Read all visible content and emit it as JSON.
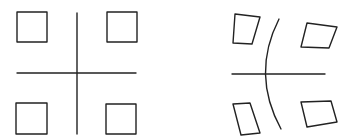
{
  "diagram": {
    "background": "#ffffff",
    "stroke_color": "#222222",
    "stroke_width": 1.4,
    "panels": [
      {
        "name": "undistorted-grid",
        "horizontal_line": {
          "x1": 17,
          "y1": 73,
          "x2": 136,
          "y2": 73
        },
        "vertical_line": {
          "x1": 77,
          "y1": 13,
          "x2": 77,
          "y2": 134
        },
        "squares": [
          {
            "points": "17,12 47,12 47,42 17,42"
          },
          {
            "points": "107,12 137,12 137,42 107,42"
          },
          {
            "points": "16,103 47,103 47,134 16,134"
          },
          {
            "points": "106,104 136,104 136,134 106,134"
          }
        ]
      },
      {
        "name": "distorted-grid",
        "horizontal_line": {
          "x1": 232,
          "y1": 74,
          "x2": 325,
          "y2": 74
        },
        "curve": {
          "d": "M 279 19 Q 251 74 281 129"
        },
        "quads": [
          {
            "points": "235,14 260,17 252,44 233,43"
          },
          {
            "points": "307,23 337,27 329,48 301,47"
          },
          {
            "points": "233,104 250,103 260,133 241,135"
          },
          {
            "points": "301,102 331,101 337,122 307,127"
          }
        ]
      }
    ]
  }
}
